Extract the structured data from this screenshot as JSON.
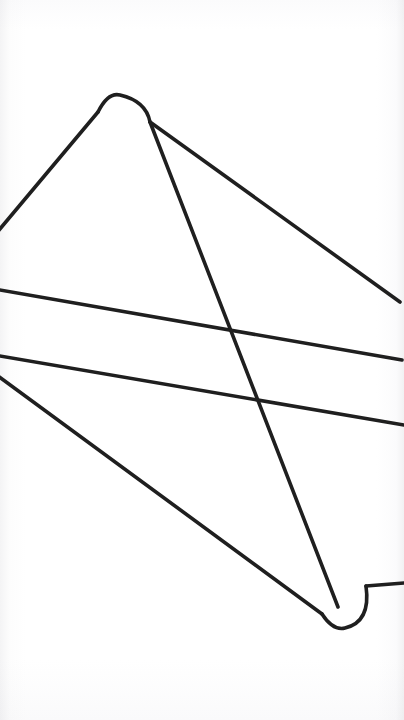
{
  "canvas": {
    "width": 404,
    "height": 720,
    "background_color": "#ffffff",
    "paper_tone": "#fbfbfc"
  },
  "artwork": {
    "title": "Continuous Line Drawing",
    "description": "Single unbroken serpentine line with rounded hairpin turns at top-left and bottom-right",
    "stroke_color": "#1f1f1f",
    "stroke_width": 3.6,
    "stroke_linecap": "round",
    "stroke_linejoin": "round",
    "fill": "none",
    "path": "M -6 236 L 98 112 Q 108 92 126 96 Q 146 101 150 122 L 400 302 M 150 122 L 338 607 M -6 289 L 402 360 M -6 355 L 404 425 M -6 373 L 322 614 Q 334 630 350 627 Q 368 622 372 604 Q 374 596 366 586 L 404 583",
    "segments": [
      {
        "name": "upper-left-ascender",
        "from": [
          -6,
          236
        ],
        "to": [
          98,
          112
        ]
      },
      {
        "name": "top-hairpin-turn",
        "apex": [
          120,
          95
        ],
        "radius": 28
      },
      {
        "name": "upper-right-descender",
        "from": [
          150,
          122
        ],
        "to": [
          400,
          302
        ]
      },
      {
        "name": "long-diagonal-down-right",
        "from": [
          150,
          122
        ],
        "to": [
          338,
          607
        ]
      },
      {
        "name": "upper-horizontal-crossbar",
        "from": [
          -6,
          289
        ],
        "to": [
          402,
          360
        ]
      },
      {
        "name": "lower-horizontal-crossbar",
        "from": [
          -6,
          355
        ],
        "to": [
          404,
          425
        ]
      },
      {
        "name": "lower-left-descender",
        "from": [
          -6,
          373
        ],
        "to": [
          322,
          614
        ]
      },
      {
        "name": "bottom-hairpin-turn",
        "apex": [
          345,
          628
        ],
        "radius": 26
      },
      {
        "name": "bottom-right-exit",
        "from": [
          366,
          586
        ],
        "to": [
          404,
          583
        ]
      }
    ],
    "edge_crossings": {
      "left": [
        236,
        289,
        355,
        373
      ],
      "right": [
        302,
        360,
        425,
        583
      ]
    }
  },
  "watermark": {
    "top_line_1": "",
    "top_line_2": "",
    "bottom_line": "",
    "opacity": 0.014
  }
}
